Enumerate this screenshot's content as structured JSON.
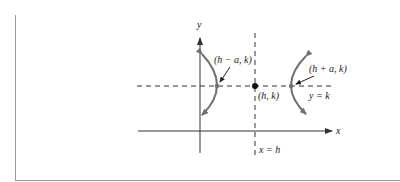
{
  "diagram": {
    "type": "hyperbola-horizontal-transverse-axis",
    "axes": {
      "x_label": "x",
      "y_label": "y"
    },
    "center": {
      "label": "(h, k)"
    },
    "vertices": [
      {
        "label": "(h − a, k)",
        "side": "left"
      },
      {
        "label": "(h + a, k)",
        "side": "right"
      }
    ],
    "lines": [
      {
        "label": "y = k",
        "orientation": "horizontal",
        "style": "dashed"
      },
      {
        "label": "x = h",
        "orientation": "vertical",
        "style": "dashed"
      }
    ],
    "colors": {
      "curve": "#707070",
      "axis": "#333333",
      "dashed": "#333333",
      "frame": "#9a9a9a"
    }
  }
}
